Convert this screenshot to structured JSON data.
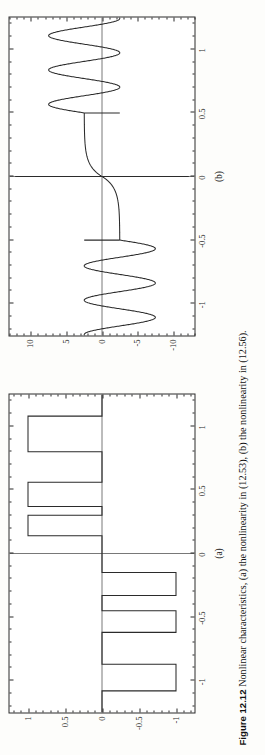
{
  "figure": {
    "number": "Figure 12.12",
    "caption": "Nonlinear characteristics, (a) the nonlinearity in (12.53), (b) the nonlinearity in (12.56)."
  },
  "panels": [
    {
      "key": "a",
      "label": "(a)"
    },
    {
      "key": "b",
      "label": "(b)"
    }
  ],
  "chart_data": [
    {
      "type": "line",
      "panel": "(a)",
      "title": "",
      "xlabel": "",
      "ylabel": "",
      "xlim": [
        -1.25,
        1.25
      ],
      "ylim": [
        -1.25,
        1.25
      ],
      "xticks": [
        -1,
        -0.5,
        0,
        0.5,
        1
      ],
      "xticklabels": [
        "-1",
        "-0.5",
        "0",
        "0.5",
        "1"
      ],
      "yticks": [
        -1,
        -0.5,
        0,
        0.5,
        1
      ],
      "yticklabels": [
        "-1",
        "-0.5",
        "0",
        "0.5",
        "1"
      ],
      "grid": false,
      "legend": null,
      "description": "Staircase / quantizer nonlinearity: piecewise-constant steps alternating between 0 and +/-1.",
      "steps": [
        {
          "x_start": -1.25,
          "x_end": -1.08,
          "y": 0
        },
        {
          "x_start": -1.08,
          "x_end": -0.87,
          "y": -1
        },
        {
          "x_start": -0.87,
          "x_end": -0.62,
          "y": 0
        },
        {
          "x_start": -0.62,
          "x_end": -0.45,
          "y": -1
        },
        {
          "x_start": -0.45,
          "x_end": -0.33,
          "y": 0
        },
        {
          "x_start": -0.33,
          "x_end": -0.15,
          "y": -1
        },
        {
          "x_start": -0.15,
          "x_end": 0.0,
          "y": 0
        },
        {
          "x_start": 0.0,
          "x_end": 0.14,
          "y": 0
        },
        {
          "x_start": 0.14,
          "x_end": 0.3,
          "y": 1
        },
        {
          "x_start": 0.3,
          "x_end": 0.37,
          "y": 0
        },
        {
          "x_start": 0.37,
          "x_end": 0.56,
          "y": 1
        },
        {
          "x_start": 0.56,
          "x_end": 0.8,
          "y": 0
        },
        {
          "x_start": 0.8,
          "x_end": 1.08,
          "y": 1
        },
        {
          "x_start": 1.08,
          "x_end": 1.25,
          "y": 0
        }
      ]
    },
    {
      "type": "line",
      "panel": "(b)",
      "title": "",
      "xlabel": "",
      "ylabel": "",
      "xlim": [
        -1.25,
        1.25
      ],
      "ylim": [
        -13,
        13
      ],
      "xticks": [
        -1,
        -0.5,
        0,
        0.5,
        1
      ],
      "xticklabels": [
        "-1",
        "-0.5",
        "0",
        "0.5",
        "1"
      ],
      "yticks": [
        -10,
        -5,
        0,
        5,
        10
      ],
      "yticklabels": [
        "-10",
        "-5",
        "0",
        "5",
        "10"
      ],
      "grid": false,
      "legend": null,
      "description": "Odd nonlinearity: hyperbolic blow-up near the origin saturating to +/-2.5, then a large-amplitude oscillation for |x| > 0.5 reaching about +/-7.5."
    }
  ]
}
